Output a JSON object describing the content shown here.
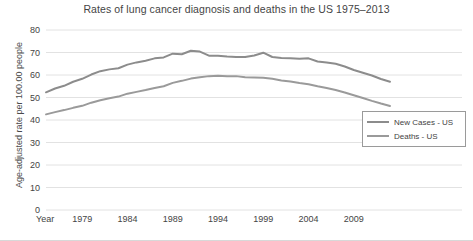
{
  "chart_data": {
    "type": "line",
    "title": "Rates of lung cancer diagnosis and deaths in the US 1975–2013",
    "xlabel": "Year",
    "ylabel": "Age-adjusted rate per 100.00 people",
    "xlim": [
      1975,
      2013
    ],
    "ylim": [
      0,
      80
    ],
    "grid": true,
    "legend_position": "right",
    "yticks": [
      80,
      70,
      60,
      50,
      40,
      30,
      20,
      10,
      0
    ],
    "xticks": [
      1979,
      1984,
      1989,
      1994,
      1999,
      2004,
      2009
    ],
    "x": [
      1975,
      1976,
      1977,
      1978,
      1979,
      1980,
      1981,
      1982,
      1983,
      1984,
      1985,
      1986,
      1987,
      1988,
      1989,
      1990,
      1991,
      1992,
      1993,
      1994,
      1995,
      1996,
      1997,
      1998,
      1999,
      2000,
      2001,
      2002,
      2003,
      2004,
      2005,
      2006,
      2007,
      2008,
      2009,
      2010,
      2011,
      2012,
      2013
    ],
    "series": [
      {
        "name": "New Cases - US",
        "color": "#8c8c8c",
        "values": [
          52.3,
          54.0,
          55.2,
          57.0,
          58.3,
          60.2,
          61.7,
          62.5,
          63.0,
          64.6,
          65.6,
          66.3,
          67.4,
          67.8,
          69.5,
          69.2,
          70.8,
          70.4,
          68.6,
          68.6,
          68.2,
          68.0,
          68.0,
          68.7,
          69.9,
          68.0,
          67.6,
          67.5,
          67.2,
          67.4,
          66.0,
          65.6,
          65.0,
          63.8,
          62.2,
          61.0,
          59.8,
          58.2,
          57.0
        ]
      },
      {
        "name": "Deaths - US",
        "color": "#9a9a9a",
        "values": [
          42.5,
          43.5,
          44.4,
          45.4,
          46.3,
          47.7,
          48.8,
          49.7,
          50.4,
          51.7,
          52.5,
          53.3,
          54.2,
          55.0,
          56.5,
          57.4,
          58.4,
          59.0,
          59.5,
          59.7,
          59.5,
          59.5,
          59.0,
          58.9,
          58.8,
          58.3,
          57.6,
          57.1,
          56.4,
          55.9,
          55.0,
          54.2,
          53.3,
          52.2,
          51.0,
          49.8,
          48.5,
          47.3,
          46.2
        ]
      }
    ]
  },
  "legend": {
    "items": [
      {
        "label": "New Cases - US"
      },
      {
        "label": "Deaths - US"
      }
    ]
  },
  "axis": {
    "x_axis_name": "Year"
  }
}
